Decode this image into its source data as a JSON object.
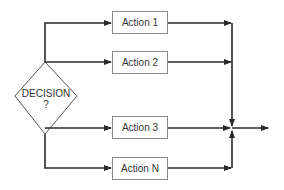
{
  "diagram": {
    "type": "flowchart",
    "decision": {
      "label": "DECISION",
      "sublabel": "?"
    },
    "actions": [
      {
        "id": "a1",
        "label": "Action 1"
      },
      {
        "id": "a2",
        "label": "Action 2"
      },
      {
        "id": "a3",
        "label": "Action 3"
      },
      {
        "id": "aN",
        "label": "Action N"
      }
    ],
    "colors": {
      "line": "#2a2a2a",
      "box_border": "#8a8a8a",
      "text": "#333333"
    }
  }
}
